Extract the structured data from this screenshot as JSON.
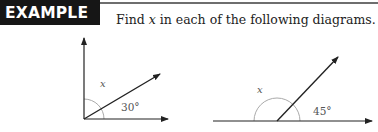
{
  "header": {
    "badge_label": "EXAMPLE 13",
    "instruction_prefix": "Find ",
    "instruction_variable": "x",
    "instruction_suffix": " in each of the following diagrams."
  },
  "diagrams": [
    {
      "id": "left",
      "unknown_label": "x",
      "given_angle_label": "30°",
      "description": "Right angle formed by vertical and horizontal rays, split by a ray at 30° above horizontal; x is the remaining angle"
    },
    {
      "id": "right",
      "unknown_label": "x",
      "given_angle_label": "45°",
      "description": "Straight line split by a ray at 45°; x is the supplementary angle"
    }
  ],
  "colors": {
    "badge_bg": "#161616",
    "badge_text": "#ffffff",
    "line": "#222222",
    "arc": "#aaaaaa",
    "label": "#555555"
  }
}
